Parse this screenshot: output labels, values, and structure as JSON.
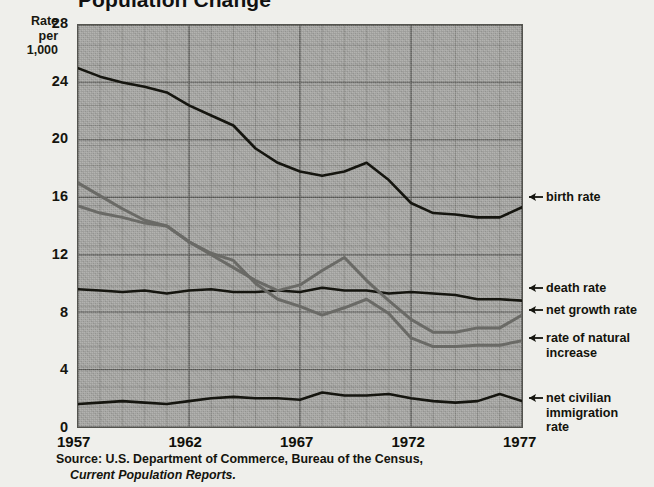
{
  "title": "Population Change",
  "axis": {
    "y_caption": "Rate\nper\n1,000",
    "y_ticks": [
      "0",
      "4",
      "8",
      "12",
      "16",
      "20",
      "24",
      "28"
    ],
    "x_ticks": [
      "1957",
      "1962",
      "1967",
      "1972",
      "1977"
    ]
  },
  "callouts": {
    "birth": "birth rate",
    "death": "death rate",
    "growth": "net growth rate",
    "natural": "rate of natural\nincrease",
    "immigration": "net civilian\nimmigration\nrate"
  },
  "source": {
    "line1": "Source: U.S. Department of Commerce, Bureau of the Census,",
    "line2": "Current Population Reports."
  },
  "colors": {
    "plot_bg": "#9d9d9a",
    "grid": "#6f6f6b",
    "grid_major": "#4d4d49",
    "dark_line": "#15150f",
    "gray_line": "#6a6a66",
    "page_bg": "#efefeb"
  },
  "chart_data": {
    "type": "line",
    "title": "Population Change",
    "xlabel": "",
    "ylabel": "Rate per 1,000",
    "xlim": [
      1957,
      1977
    ],
    "ylim": [
      0,
      28
    ],
    "ytick_values": [
      0,
      4,
      8,
      12,
      16,
      20,
      24,
      28
    ],
    "xtick_values": [
      1957,
      1962,
      1967,
      1972,
      1977
    ],
    "grid": true,
    "legend": "right-side callout labels",
    "x": [
      1957,
      1958,
      1959,
      1960,
      1961,
      1962,
      1963,
      1964,
      1965,
      1966,
      1967,
      1968,
      1969,
      1970,
      1971,
      1972,
      1973,
      1974,
      1975,
      1976,
      1977
    ],
    "series": [
      {
        "name": "birth rate",
        "color": "#15150f",
        "values": [
          25.0,
          24.4,
          24.0,
          23.7,
          23.3,
          22.4,
          21.7,
          21.0,
          19.4,
          18.4,
          17.8,
          17.5,
          17.8,
          18.4,
          17.2,
          15.6,
          14.9,
          14.8,
          14.6,
          14.6,
          15.3
        ]
      },
      {
        "name": "death rate",
        "color": "#15150f",
        "values": [
          9.6,
          9.5,
          9.4,
          9.5,
          9.3,
          9.5,
          9.6,
          9.4,
          9.4,
          9.5,
          9.4,
          9.7,
          9.5,
          9.5,
          9.3,
          9.4,
          9.3,
          9.2,
          8.9,
          8.9,
          8.8
        ]
      },
      {
        "name": "net growth rate",
        "color": "#6a6a66",
        "values": [
          17.0,
          16.1,
          15.2,
          14.4,
          14.0,
          12.9,
          12.0,
          11.1,
          10.2,
          9.5,
          9.9,
          10.9,
          11.8,
          10.2,
          8.8,
          7.5,
          6.6,
          6.6,
          6.9,
          6.9,
          7.8
        ]
      },
      {
        "name": "rate of natural increase",
        "color": "#6a6a66",
        "values": [
          15.4,
          14.9,
          14.6,
          14.2,
          14.0,
          12.9,
          12.1,
          11.6,
          10.0,
          8.9,
          8.4,
          7.8,
          8.3,
          8.9,
          7.9,
          6.2,
          5.6,
          5.6,
          5.7,
          5.7,
          6.0
        ]
      },
      {
        "name": "net civilian immigration rate",
        "color": "#15150f",
        "values": [
          1.6,
          1.7,
          1.8,
          1.7,
          1.6,
          1.8,
          2.0,
          2.1,
          2.0,
          2.0,
          1.9,
          2.4,
          2.2,
          2.2,
          2.3,
          2.0,
          1.8,
          1.7,
          1.8,
          2.3,
          1.8
        ]
      }
    ]
  }
}
